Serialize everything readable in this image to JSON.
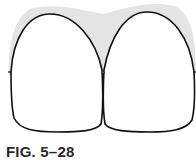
{
  "figure": {
    "caption": "FIG. 5–28",
    "colors": {
      "gingiva": "#e4e4e4",
      "tooth_fill": "#ffffff",
      "outline": "#111111",
      "caption": "#2a2a2a"
    }
  }
}
